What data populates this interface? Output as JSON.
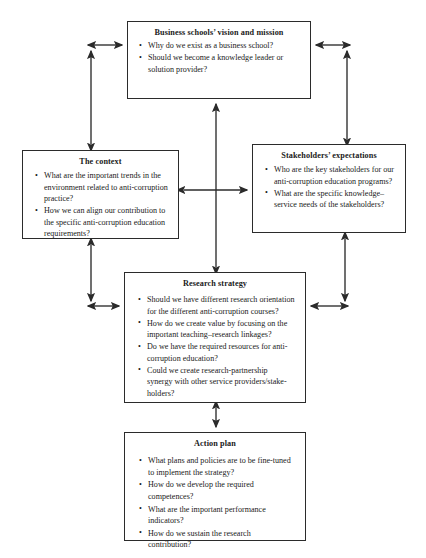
{
  "diagram": {
    "line_color": "#2b2b2b",
    "background_color": "#ffffff",
    "nodes": [
      {
        "id": "vision",
        "title": "Business schools’ vision and mission",
        "items": [
          "Why do we exist as a business school?",
          "Should we become a knowledge leader or solution provider?"
        ]
      },
      {
        "id": "context",
        "title": "The context",
        "items": [
          "What are the important trends in the environment related to anti-corruption practice?",
          "How we can align our contribution to the specific anti-corruption education requirements?"
        ]
      },
      {
        "id": "stakeholders",
        "title": "Stakeholders’ expectations",
        "items": [
          "Who are the key stakeholders for our anti-corruption education programs?",
          "What are the specific knowledge–service needs of the stakeholders?"
        ]
      },
      {
        "id": "research",
        "title": "Research strategy",
        "items": [
          "Should we have different research orientation for the different anti-corruption courses?",
          "How do we create value by focusing on the important teaching–research linkages?",
          "Do we have the required resources for anti-corruption education?",
          "Could we create research-partnership synergy with other service providers/stake-holders?"
        ]
      },
      {
        "id": "action",
        "title": "Action plan",
        "items": [
          "What plans and policies are to be fine-tuned to implement the strategy?",
          "How do we develop the required competences?",
          "What are the important performance indicators?",
          "How do we sustain the research contribution?"
        ]
      }
    ],
    "connectors": [
      {
        "name": "vision-to-context-left-riser",
        "from": "vision",
        "to": "context",
        "style": "double-arrow"
      },
      {
        "name": "vision-to-stakeholders-right-riser",
        "from": "vision",
        "to": "stakeholders",
        "style": "double-arrow"
      },
      {
        "name": "research-to-vision-center",
        "from": "research",
        "to": "vision",
        "style": "double-arrow"
      },
      {
        "name": "context-to-stakeholders",
        "from": "context",
        "to": "stakeholders",
        "style": "double-arrow"
      },
      {
        "name": "context-to-research-left",
        "from": "context",
        "to": "research",
        "style": "double-arrow"
      },
      {
        "name": "stakeholders-to-research-right",
        "from": "stakeholders",
        "to": "research",
        "style": "double-arrow"
      },
      {
        "name": "research-to-action",
        "from": "research",
        "to": "action",
        "style": "double-arrow"
      }
    ]
  }
}
